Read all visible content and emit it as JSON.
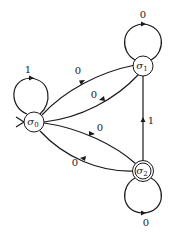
{
  "diagram": {
    "type": "finite-state-automaton",
    "states": [
      {
        "id": "s0",
        "label": "σ",
        "subscript": "0",
        "start": true,
        "accepting": false
      },
      {
        "id": "s1",
        "label": "σ",
        "subscript": "1",
        "start": false,
        "accepting": false
      },
      {
        "id": "s2",
        "label": "σ",
        "subscript": "2",
        "start": false,
        "accepting": true
      }
    ],
    "transitions": [
      {
        "from": "s0",
        "to": "s0",
        "label": "1"
      },
      {
        "from": "s0",
        "to": "s1",
        "label": "0"
      },
      {
        "from": "s1",
        "to": "s0",
        "label": "0"
      },
      {
        "from": "s1",
        "to": "s1",
        "label": "0"
      },
      {
        "from": "s0",
        "to": "s2",
        "label": "0"
      },
      {
        "from": "s2",
        "to": "s0",
        "label": "0"
      },
      {
        "from": "s2",
        "to": "s1",
        "label": "1"
      },
      {
        "from": "s2",
        "to": "s2",
        "label": "0"
      }
    ]
  }
}
